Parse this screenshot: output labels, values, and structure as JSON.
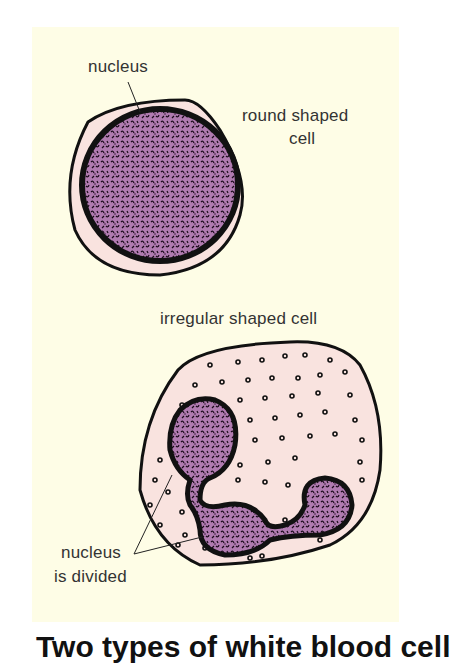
{
  "diagram": {
    "background_color": "#fefde6",
    "cytoplasm_color": "#f9e3df",
    "nucleus_color": "#b07bb0",
    "outline_color": "#111111",
    "labels": {
      "nucleus_top": "nucleus",
      "round_cell_line1": "round shaped",
      "round_cell_line2": "cell",
      "irregular_cell": "irregular shaped cell",
      "nucleus_divided_line1": "nucleus",
      "nucleus_divided_line2": "is divided"
    },
    "caption": "Two types of white blood cell"
  }
}
